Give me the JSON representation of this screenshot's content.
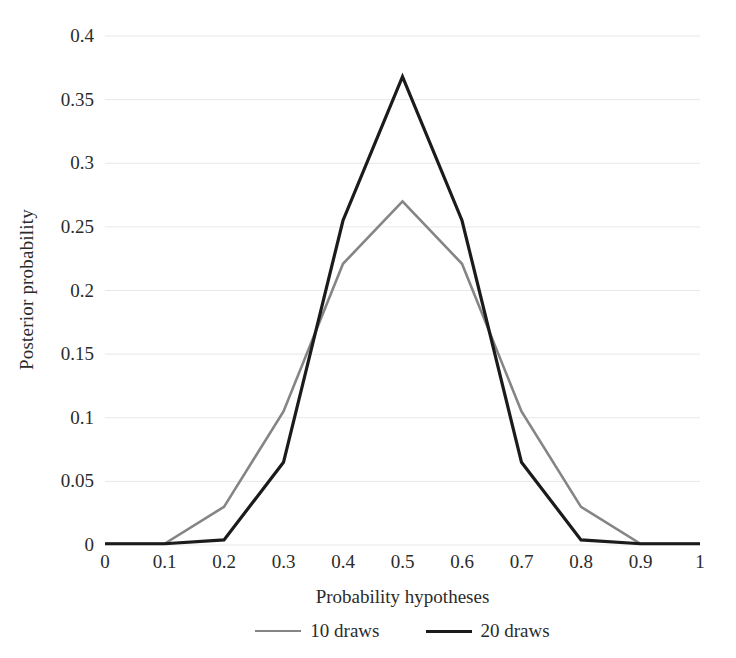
{
  "chart_data": {
    "type": "line",
    "title": "",
    "xlabel": "Probability hypotheses",
    "ylabel": "Posterior probability",
    "x": [
      0,
      0.1,
      0.2,
      0.3,
      0.4,
      0.5,
      0.6,
      0.7,
      0.8,
      0.9,
      1
    ],
    "xtick_labels": [
      "0",
      "0.1",
      "0.2",
      "0.3",
      "0.4",
      "0.5",
      "0.6",
      "0.7",
      "0.8",
      "0.9",
      "1"
    ],
    "ytick_labels": [
      "0",
      "0.05",
      "0.1",
      "0.15",
      "0.2",
      "0.25",
      "0.3",
      "0.35",
      "0.4"
    ],
    "ytick_values": [
      0,
      0.05,
      0.1,
      0.15,
      0.2,
      0.25,
      0.3,
      0.35,
      0.4
    ],
    "xlim": [
      0,
      1
    ],
    "ylim": [
      0,
      0.4
    ],
    "grid": "horizontal",
    "legend_position": "bottom",
    "series": [
      {
        "name": "10 draws",
        "color": "#858585",
        "width": 2.6,
        "values": [
          0.001,
          0.001,
          0.03,
          0.105,
          0.221,
          0.27,
          0.221,
          0.105,
          0.03,
          0.001,
          0.001
        ]
      },
      {
        "name": "20 draws",
        "color": "#1b1b1b",
        "width": 3.2,
        "values": [
          0.001,
          0.001,
          0.004,
          0.065,
          0.255,
          0.368,
          0.255,
          0.065,
          0.004,
          0.001,
          0.001
        ]
      }
    ]
  },
  "legend": {
    "entries": [
      {
        "label": "10 draws"
      },
      {
        "label": "20 draws"
      }
    ]
  },
  "colors": {
    "gridline": "#e8e8e8",
    "text": "#2b2b2b",
    "background": "#ffffff"
  }
}
